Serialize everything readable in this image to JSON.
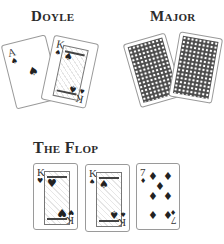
{
  "headings": {
    "doyle": "Doyle",
    "major": "Major",
    "flop": "The Flop"
  },
  "doyle_hand": [
    {
      "rank": "A",
      "suit": "spade",
      "suit_glyph": "♠",
      "face_up": true
    },
    {
      "rank": "K",
      "suit": "spade",
      "suit_glyph": "♠",
      "face_up": true
    }
  ],
  "major_hand": [
    {
      "face_up": false,
      "back_pattern": "lattice"
    },
    {
      "face_up": false,
      "back_pattern": "lattice"
    }
  ],
  "flop": [
    {
      "rank": "K",
      "suit": "heart",
      "suit_glyph": "♥",
      "face_up": true
    },
    {
      "rank": "K",
      "suit": "spade",
      "suit_glyph": "♠",
      "face_up": true
    },
    {
      "rank": "7",
      "suit": "diamond",
      "suit_glyph": "♦",
      "face_up": true
    }
  ],
  "colors": {
    "ink": "#2b2b2b",
    "card_border": "#9a9a9a",
    "card_back": "#4a4a4a"
  }
}
